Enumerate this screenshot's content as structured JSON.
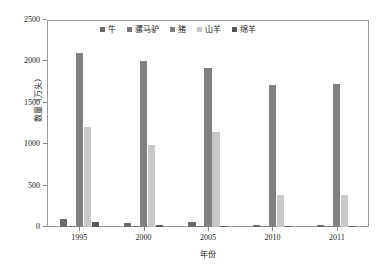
{
  "chart_data": {
    "type": "bar",
    "title": "",
    "xlabel": "年份",
    "ylabel": "数量（万头）",
    "categories": [
      "1995",
      "2000",
      "2005",
      "2010",
      "2011"
    ],
    "ylim": [
      0,
      2500
    ],
    "yticks": [
      "0",
      "500",
      "1000",
      "1500",
      "2000",
      "2500"
    ],
    "ytick_values": [
      0,
      500,
      1000,
      1500,
      2000,
      2500
    ],
    "grid": false,
    "legend_position": "top-center",
    "series": [
      {
        "name": "牛",
        "color": "#6b6b6b",
        "values": [
          100,
          50,
          55,
          25,
          20
        ]
      },
      {
        "name": "骡马驴",
        "color": "#787878",
        "values": [
          10,
          5,
          3,
          2,
          2
        ]
      },
      {
        "name": "猪",
        "color": "#808080",
        "values": [
          2105,
          2000,
          1915,
          1710,
          1725
        ]
      },
      {
        "name": "山羊",
        "color": "#c8c8c8",
        "values": [
          1205,
          990,
          1145,
          390,
          390
        ]
      },
      {
        "name": "绵羊",
        "color": "#5a5a5a",
        "values": [
          55,
          20,
          12,
          8,
          5
        ]
      }
    ]
  }
}
